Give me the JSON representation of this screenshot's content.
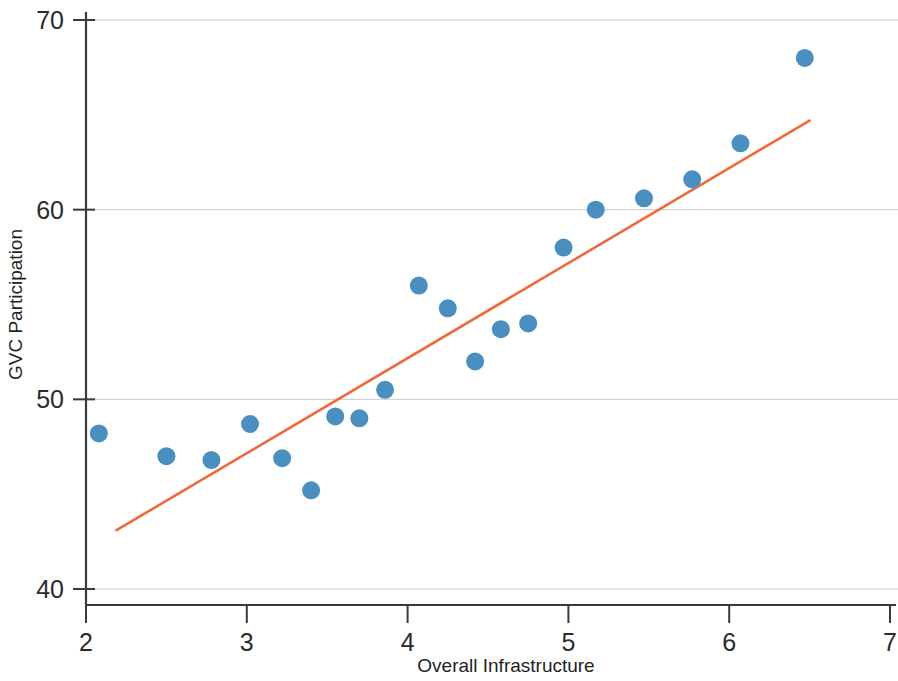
{
  "chart_data": {
    "type": "scatter",
    "title": "",
    "subtitle": "",
    "xlabel": "Overall Infrastructure",
    "ylabel": "GVC Participation",
    "xlim": [
      2,
      7
    ],
    "ylim": [
      40,
      70
    ],
    "xticks": [
      2,
      3,
      4,
      5,
      6,
      7
    ],
    "xtick_labels": [
      "2",
      "3",
      "4",
      "5",
      "6",
      "7"
    ],
    "yticks": [
      40,
      50,
      60,
      70
    ],
    "ytick_labels": [
      "40",
      "50",
      "60",
      "70"
    ],
    "grid": "horizontal",
    "legend": "none",
    "annotations": [],
    "colors": {
      "point": "#4a8fc0",
      "trendline": "#ee6a3c",
      "grid": "#c9c9c9",
      "axis": "#3b3b3b",
      "text": "#1f1f1f",
      "background": "#ffffff"
    },
    "marker": {
      "shape": "circle",
      "radius_px": 9
    },
    "series": [
      {
        "name": "Countries",
        "type": "scatter",
        "points": [
          {
            "x": 2.08,
            "y": 48.2
          },
          {
            "x": 2.5,
            "y": 47.0
          },
          {
            "x": 2.78,
            "y": 46.8
          },
          {
            "x": 3.02,
            "y": 48.7
          },
          {
            "x": 3.22,
            "y": 46.9
          },
          {
            "x": 3.4,
            "y": 45.2
          },
          {
            "x": 3.55,
            "y": 49.1
          },
          {
            "x": 3.7,
            "y": 49.0
          },
          {
            "x": 3.86,
            "y": 50.5
          },
          {
            "x": 4.07,
            "y": 56.0
          },
          {
            "x": 4.25,
            "y": 54.8
          },
          {
            "x": 4.42,
            "y": 52.0
          },
          {
            "x": 4.58,
            "y": 53.7
          },
          {
            "x": 4.75,
            "y": 54.0
          },
          {
            "x": 4.97,
            "y": 58.0
          },
          {
            "x": 5.17,
            "y": 60.0
          },
          {
            "x": 5.47,
            "y": 60.6
          },
          {
            "x": 5.77,
            "y": 61.6
          },
          {
            "x": 6.07,
            "y": 63.5
          },
          {
            "x": 6.47,
            "y": 68.0
          }
        ]
      },
      {
        "name": "Linear fit",
        "type": "line",
        "endpoints": [
          {
            "x": 2.19,
            "y": 43.1
          },
          {
            "x": 6.5,
            "y": 64.7
          }
        ]
      }
    ]
  },
  "axes_geometry": {
    "plot_left_px": 86,
    "plot_right_px": 890,
    "plot_top_px": 20,
    "plot_bottom_px": 589
  }
}
